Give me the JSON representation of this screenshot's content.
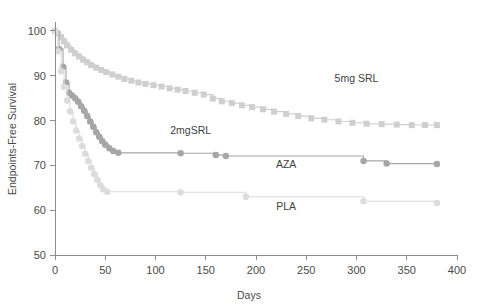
{
  "chart_data": {
    "type": "line",
    "title": "",
    "xlabel": "Days",
    "ylabel": "Endpoints-Free Survival",
    "xlim": [
      0,
      400
    ],
    "ylim": [
      50,
      102
    ],
    "xticks": [
      0,
      50,
      100,
      150,
      200,
      250,
      300,
      350,
      400
    ],
    "xtick_labels": [
      "0",
      "50",
      "100",
      "150",
      "200",
      "250",
      "300",
      "350",
      "400"
    ],
    "yticks": [
      50,
      60,
      70,
      80,
      90,
      100
    ],
    "ytick_labels": [
      "50",
      "60",
      "70",
      "80",
      "90",
      "100"
    ],
    "grid": false,
    "legend_position": "inline-annotations",
    "series": [
      {
        "name": "5mg SRL",
        "label": "5mg SRL",
        "color": "#cfcfcf",
        "marker": "square",
        "marker_size": 6,
        "line_width": 1.1,
        "label_x": 300,
        "label_y": 88.5,
        "points": [
          [
            0,
            100.0
          ],
          [
            3,
            99.4
          ],
          [
            6,
            98.6
          ],
          [
            9,
            97.7
          ],
          [
            12,
            96.8
          ],
          [
            16,
            95.8
          ],
          [
            20,
            95.0
          ],
          [
            24,
            94.3
          ],
          [
            28,
            93.6
          ],
          [
            32,
            93.0
          ],
          [
            36,
            92.4
          ],
          [
            41,
            91.8
          ],
          [
            46,
            91.3
          ],
          [
            51,
            90.8
          ],
          [
            57,
            90.3
          ],
          [
            63,
            89.8
          ],
          [
            69,
            89.3
          ],
          [
            76,
            88.9
          ],
          [
            83,
            88.5
          ],
          [
            90,
            88.2
          ],
          [
            98,
            87.9
          ],
          [
            106,
            87.6
          ],
          [
            114,
            87.2
          ],
          [
            122,
            86.9
          ],
          [
            130,
            86.6
          ],
          [
            139,
            86.2
          ],
          [
            148,
            85.8
          ],
          [
            157,
            84.9
          ],
          [
            166,
            84.3
          ],
          [
            176,
            83.9
          ],
          [
            186,
            83.4
          ],
          [
            196,
            83.0
          ],
          [
            207,
            82.5
          ],
          [
            218,
            82.0
          ],
          [
            230,
            81.5
          ],
          [
            242,
            81.0
          ],
          [
            255,
            80.5
          ],
          [
            268,
            80.2
          ],
          [
            282,
            79.8
          ],
          [
            296,
            79.5
          ],
          [
            310,
            79.3
          ],
          [
            325,
            79.2
          ],
          [
            340,
            79.1
          ],
          [
            355,
            79.0
          ],
          [
            368,
            79.0
          ],
          [
            380,
            79.0
          ]
        ]
      },
      {
        "name": "2mgSRL",
        "label": "2mgSRL",
        "color": "#a6a6a6",
        "marker": "circle",
        "marker_size": 6.5,
        "line_width": 1.1,
        "label_x": 135,
        "label_y": 77.0,
        "points": [
          [
            0,
            100.0
          ],
          [
            4,
            96.0
          ],
          [
            8,
            92.0
          ],
          [
            11,
            88.5
          ],
          [
            14,
            86.2
          ],
          [
            17,
            85.6
          ],
          [
            20,
            85.0
          ],
          [
            23,
            84.2
          ],
          [
            26,
            83.2
          ],
          [
            29,
            82.2
          ],
          [
            32,
            81.0
          ],
          [
            35,
            79.8
          ],
          [
            38,
            78.6
          ],
          [
            41,
            77.4
          ],
          [
            44,
            76.4
          ],
          [
            47,
            75.4
          ],
          [
            50,
            74.6
          ],
          [
            54,
            73.8
          ],
          [
            58,
            73.2
          ],
          [
            63,
            72.8
          ],
          [
            125,
            72.7
          ],
          [
            160,
            72.3
          ],
          [
            170,
            72.1
          ],
          [
            307,
            71.0
          ],
          [
            330,
            70.4
          ],
          [
            380,
            70.3
          ]
        ]
      },
      {
        "name": "AZA",
        "label": "AZA",
        "color": "#b5b5b5",
        "marker": "circle",
        "marker_size": 6.5,
        "line_width": 1.1,
        "label_x": 230,
        "label_y": 69.5,
        "points": []
      },
      {
        "name": "PLA",
        "label": "PLA",
        "color": "#dcdcdc",
        "marker": "circle",
        "marker_size": 6.5,
        "line_width": 1.1,
        "label_x": 230,
        "label_y": 60.0,
        "points": [
          [
            0,
            100.0
          ],
          [
            3,
            95.5
          ],
          [
            6,
            91.0
          ],
          [
            9,
            87.5
          ],
          [
            12,
            84.5
          ],
          [
            15,
            82.0
          ],
          [
            18,
            79.8
          ],
          [
            21,
            77.8
          ],
          [
            24,
            76.0
          ],
          [
            27,
            74.3
          ],
          [
            30,
            72.6
          ],
          [
            33,
            71.0
          ],
          [
            36,
            69.5
          ],
          [
            39,
            68.1
          ],
          [
            42,
            66.8
          ],
          [
            45,
            65.6
          ],
          [
            48,
            64.7
          ],
          [
            52,
            64.1
          ],
          [
            125,
            64.0
          ],
          [
            190,
            63.0
          ],
          [
            307,
            62.0
          ],
          [
            380,
            61.6
          ]
        ]
      }
    ],
    "annotations": [
      {
        "text": "5mg SRL",
        "x": 300,
        "y": 88.5
      },
      {
        "text": "2mgSRL",
        "x": 135,
        "y": 77.0
      },
      {
        "text": "AZA",
        "x": 230,
        "y": 69.5
      },
      {
        "text": "PLA",
        "x": 230,
        "y": 60.0
      }
    ]
  },
  "axis": {
    "x_title": "Days",
    "y_title": "Endpoints-Free Survival"
  },
  "colors": {
    "axis": "#8d8d8d",
    "text": "#4a4a4a",
    "background": "#ffffff",
    "series_5mg_srl": "#cfcfcf",
    "series_2mg_srl": "#a6a6a6",
    "series_aza": "#b5b5b5",
    "series_pla": "#dcdcdc"
  }
}
